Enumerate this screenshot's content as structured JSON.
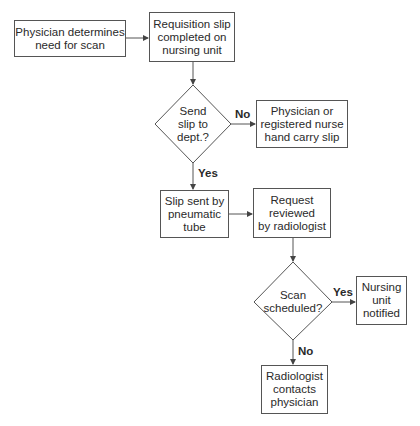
{
  "nodes": {
    "start": "Physician determines\nneed for scan",
    "requisition": "Requisition slip\ncompleted on\nnursing unit",
    "send_decision": "Send\nslip to\ndept.?",
    "hand_carry": "Physician or\nregistered nurse\nhand carry slip",
    "pneumatic": "Slip sent by\npneumatic\ntube",
    "review": "Request\nreviewed\nby radiologist",
    "scan_decision": "Scan\nscheduled?",
    "notified": "Nursing\nunit\nnotified",
    "contacts": "Radiologist\ncontacts\nphysician"
  },
  "edges": {
    "send_no": "No",
    "send_yes": "Yes",
    "scan_yes": "Yes",
    "scan_no": "No"
  },
  "colors": {
    "line": "#555555",
    "text": "#2a2a2a"
  }
}
